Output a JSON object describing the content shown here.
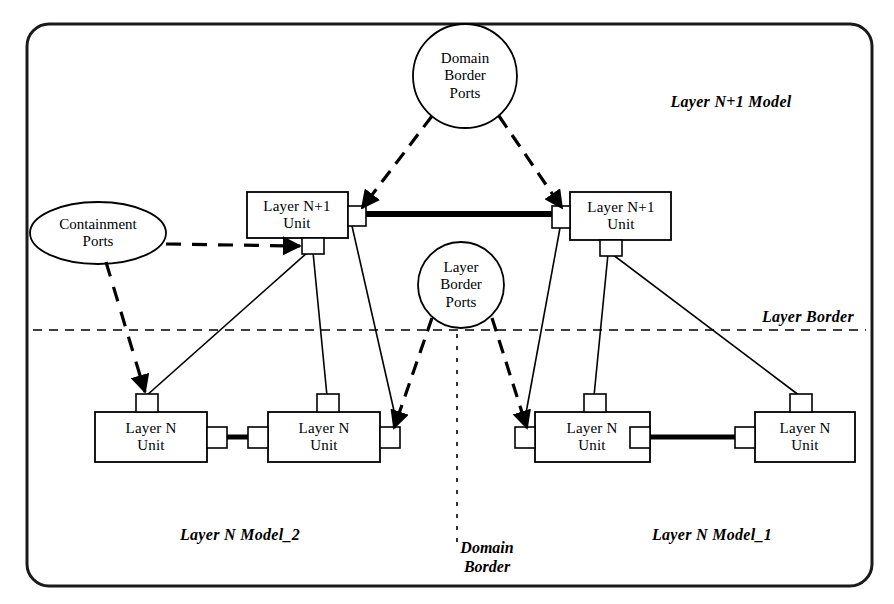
{
  "diagram": {
    "frame": {
      "border_color": "#1a1a1a"
    },
    "units": [
      {
        "id": "n1-left",
        "line1": "Layer N+1",
        "line2": "Unit"
      },
      {
        "id": "n1-right",
        "line1": "Layer N+1",
        "line2": "Unit"
      },
      {
        "id": "n-1",
        "line1": "Layer N",
        "line2": "Unit"
      },
      {
        "id": "n-2",
        "line1": "Layer N",
        "line2": "Unit"
      },
      {
        "id": "n-3",
        "line1": "Layer N",
        "line2": "Unit"
      },
      {
        "id": "n-4",
        "line1": "Layer N",
        "line2": "Unit"
      }
    ],
    "port_groups": [
      {
        "id": "domain-border-ports",
        "shape": "circle",
        "line1": "Domain",
        "line2": "Border",
        "line3": "Ports"
      },
      {
        "id": "layer-border-ports",
        "shape": "circle",
        "line1": "Layer",
        "line2": "Border",
        "line3": "Ports"
      },
      {
        "id": "containment-ports",
        "shape": "ellipse",
        "line1": "Containment",
        "line2": "Ports",
        "line3": ""
      }
    ],
    "annotations": {
      "layer_np1_model": "Layer N+1 Model",
      "layer_n_model_2": "Layer N Model_2",
      "layer_n_model_1": "Layer N Model_1",
      "layer_border": "Layer Border",
      "domain_border_line1": "Domain",
      "domain_border_line2": "Border"
    },
    "colors": {
      "stroke": "#000000",
      "fill": "#ffffff",
      "frame": "#1a1a1a"
    }
  }
}
